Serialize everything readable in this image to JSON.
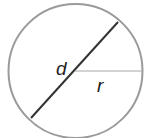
{
  "diagram": {
    "type": "circle-diameter-radius",
    "labels": {
      "diameter": "d",
      "radius": "r"
    },
    "colors": {
      "circle": "#9a9a9a",
      "diameter": "#333333",
      "radius": "#a8a8a8",
      "label": "#222222",
      "background": "#ffffff"
    }
  }
}
